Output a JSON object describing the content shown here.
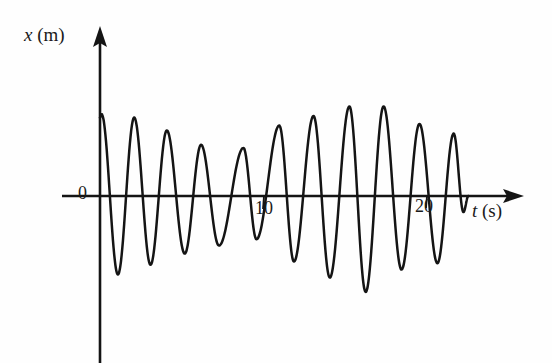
{
  "figure": {
    "background_color": "#fefefe",
    "ink_color": "#141414"
  },
  "axes": {
    "y": {
      "label_var": "x",
      "label_unit": "(m)",
      "origin_label": "0"
    },
    "x": {
      "label_var": "t",
      "label_unit": "(s)",
      "ticks": [
        {
          "value": 10,
          "label": "10"
        },
        {
          "value": 20,
          "label": "20"
        }
      ]
    }
  },
  "chart_data": {
    "type": "line",
    "title": "",
    "subtitle": "",
    "xlabel": "t (s)",
    "ylabel": "x (m)",
    "xlim": [
      0,
      25.8
    ],
    "ylim": [
      -6,
      6
    ],
    "grid": false,
    "legend": "none",
    "annotations": [],
    "xtick_values": [
      0,
      10,
      20
    ],
    "xtick_labels": [
      "0",
      "10",
      "20"
    ],
    "ytick_values": [],
    "ytick_labels": [],
    "series": [
      {
        "name": "displacement",
        "kind": "oscillation-with-beat-envelope",
        "period_seconds": 2.05,
        "start_time": 0.0,
        "end_time": 22.6,
        "peaks": [
          {
            "index": 1,
            "t": 0.1,
            "x": 5.1
          },
          {
            "index": 2,
            "t": 2.1,
            "x": 4.9
          },
          {
            "index": 3,
            "t": 4.1,
            "x": 4.1
          },
          {
            "index": 4,
            "t": 6.2,
            "x": 3.2
          },
          {
            "index": 5,
            "t": 8.8,
            "x": 3.0
          },
          {
            "index": 6,
            "t": 11.0,
            "x": 4.4
          },
          {
            "index": 7,
            "t": 13.1,
            "x": 5.0
          },
          {
            "index": 8,
            "t": 15.3,
            "x": 5.6
          },
          {
            "index": 9,
            "t": 17.4,
            "x": 5.6
          },
          {
            "index": 10,
            "t": 19.6,
            "x": 4.5
          },
          {
            "index": 11,
            "t": 21.7,
            "x": 3.9
          }
        ],
        "troughs": [
          {
            "index": 1,
            "t": 1.1,
            "x": -4.9
          },
          {
            "index": 2,
            "t": 3.1,
            "x": -4.3
          },
          {
            "index": 3,
            "t": 5.2,
            "x": -3.6
          },
          {
            "index": 4,
            "t": 7.3,
            "x": -3.1
          },
          {
            "index": 5,
            "t": 9.6,
            "x": -2.7
          },
          {
            "index": 6,
            "t": 11.9,
            "x": -4.1
          },
          {
            "index": 7,
            "t": 14.1,
            "x": -5.1
          },
          {
            "index": 8,
            "t": 16.3,
            "x": -6.0
          },
          {
            "index": 9,
            "t": 18.5,
            "x": -4.6
          },
          {
            "index": 10,
            "t": 20.7,
            "x": -4.2
          },
          {
            "index": 11,
            "t": 22.3,
            "x": -1.0
          }
        ],
        "envelope_upper": [
          {
            "t": 0.0,
            "x": 5.1
          },
          {
            "t": 2.1,
            "x": 4.9
          },
          {
            "t": 4.1,
            "x": 4.1
          },
          {
            "t": 6.2,
            "x": 3.2
          },
          {
            "t": 8.8,
            "x": 3.0
          },
          {
            "t": 11.0,
            "x": 4.4
          },
          {
            "t": 13.1,
            "x": 5.0
          },
          {
            "t": 15.3,
            "x": 5.6
          },
          {
            "t": 17.4,
            "x": 5.6
          },
          {
            "t": 19.6,
            "x": 4.5
          },
          {
            "t": 21.7,
            "x": 3.9
          }
        ]
      }
    ]
  }
}
